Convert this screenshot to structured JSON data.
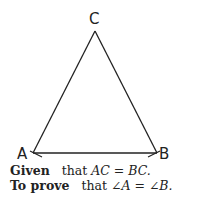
{
  "diagram": {
    "type": "isosceles-triangle",
    "vertices": {
      "A": {
        "label": "A",
        "x": 33,
        "y": 160
      },
      "B": {
        "label": "B",
        "x": 157,
        "y": 160
      },
      "C": {
        "label": "C",
        "x": 95,
        "y": 32
      }
    },
    "angle_marks": [
      "A",
      "B"
    ],
    "line_color": "#222222"
  },
  "statements": {
    "given": {
      "keyword": "Given",
      "text": "that ",
      "math": "AC = BC."
    },
    "to_prove": {
      "keyword": "To prove",
      "text": "that ",
      "math": "∠A = ∠B."
    }
  }
}
